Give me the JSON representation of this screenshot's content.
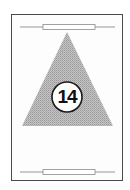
{
  "card": {
    "number": "14",
    "shape": "triangle",
    "decorations": [
      "top-bar-icon",
      "bottom-bar-icon"
    ],
    "colors": {
      "border": "#4a4a4a",
      "triangle_fill": "#b4b4b4",
      "circle_fill": "#ffffff",
      "circle_stroke": "#1a1a1a",
      "number": "#111111",
      "bar_line": "#a8a8a8",
      "bar_box_stroke": "#8a8a8a"
    }
  }
}
